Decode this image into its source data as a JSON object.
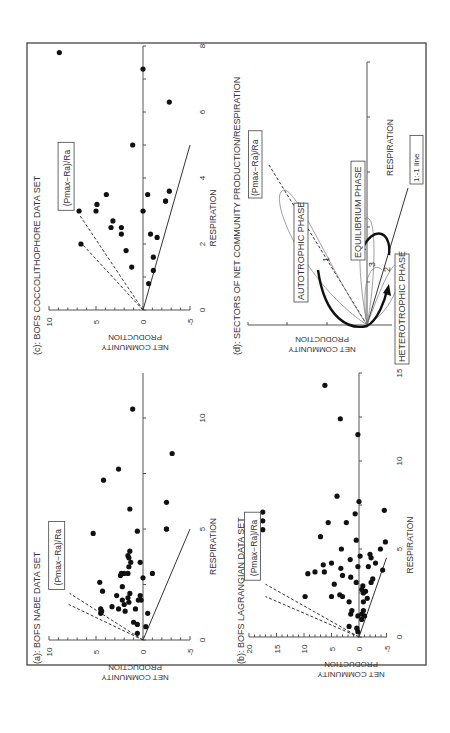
{
  "figure": {
    "orientation": "rotated 90 degrees counter-clockwise",
    "ratio_label": "(Pmax−Ra)/Ra"
  },
  "chart_data": [
    {
      "panel": "a",
      "type": "scatter",
      "title": "(a): BOFS NABE DATA SET",
      "xlabel": "RESPIRATION",
      "ylabel": "NET COMMUNITY PRODUCTION",
      "xlim": [
        0,
        13
      ],
      "ylim": [
        -5,
        10
      ],
      "x_ticks": [
        "0",
        "5",
        "10"
      ],
      "y_ticks": [
        "10",
        "5",
        "0",
        "-5"
      ],
      "annotation": "(Pmax−Ra)/Ra",
      "lines": [
        {
          "style": "solid",
          "label": "1:-1 line",
          "from": [
            0,
            0
          ],
          "to": [
            5,
            -5
          ]
        },
        {
          "style": "dashed",
          "from": [
            0,
            0
          ],
          "to": [
            2.1,
            7.8
          ]
        },
        {
          "style": "dashed",
          "from": [
            0,
            0
          ],
          "to": [
            1.6,
            7.9
          ]
        }
      ],
      "points": [
        [
          0.3,
          0.6
        ],
        [
          0.6,
          -0.3
        ],
        [
          0.8,
          1.0
        ],
        [
          0.7,
          0.6
        ],
        [
          1.2,
          -0.5
        ],
        [
          1.3,
          1.9
        ],
        [
          1.2,
          4.5
        ],
        [
          1.3,
          4.4
        ],
        [
          1.4,
          4.5
        ],
        [
          1.4,
          2.6
        ],
        [
          1.4,
          0.8
        ],
        [
          1.5,
          3.3
        ],
        [
          1.6,
          2.0
        ],
        [
          1.7,
          1.5
        ],
        [
          1.8,
          0.5
        ],
        [
          1.8,
          0.2
        ],
        [
          1.8,
          2.2
        ],
        [
          1.9,
          1.6
        ],
        [
          2.0,
          2.8
        ],
        [
          2.0,
          0.3
        ],
        [
          2.1,
          1.4
        ],
        [
          2.2,
          4.3
        ],
        [
          2.4,
          2.2
        ],
        [
          2.6,
          4.6
        ],
        [
          2.8,
          0.0
        ],
        [
          2.9,
          2.4
        ],
        [
          3.0,
          1.6
        ],
        [
          3.0,
          -1.0
        ],
        [
          3.0,
          2.0
        ],
        [
          3.0,
          2.3
        ],
        [
          3.3,
          1.5
        ],
        [
          3.5,
          1.3
        ],
        [
          3.5,
          0.3
        ],
        [
          3.7,
          1.5
        ],
        [
          3.8,
          1.6
        ],
        [
          4.0,
          1.4
        ],
        [
          4.9,
          0.6
        ],
        [
          4.8,
          5.3
        ],
        [
          5.0,
          -2.5
        ],
        [
          5.0,
          -2.5
        ],
        [
          5.9,
          1.4
        ],
        [
          6.2,
          -2.5
        ],
        [
          7.2,
          4.2
        ],
        [
          7.7,
          2.6
        ],
        [
          8.4,
          -3.1
        ],
        [
          10.4,
          1.1
        ]
      ]
    },
    {
      "panel": "b",
      "type": "scatter",
      "title": "(b): BOFS LAGRANGIAN DATA SET",
      "xlabel": "RESPIRATION",
      "ylabel": "NET COMMUNITY PRODUCTION",
      "xlim": [
        0,
        15
      ],
      "ylim": [
        -5,
        20
      ],
      "x_ticks": [
        "0",
        "5",
        "10",
        "15"
      ],
      "y_ticks": [
        "20",
        "15",
        "10",
        "5",
        "0",
        "-5"
      ],
      "annotation": "(Pmax−Ra)/Ra",
      "lines": [
        {
          "style": "solid",
          "label": "1:-1 line",
          "from": [
            0,
            0
          ],
          "to": [
            4.5,
            -5
          ]
        },
        {
          "style": "dashed",
          "from": [
            0,
            0
          ],
          "to": [
            3.0,
            17
          ]
        },
        {
          "style": "dashed",
          "from": [
            0,
            0
          ],
          "to": [
            2.3,
            17
          ]
        }
      ],
      "points": [
        [
          0.3,
          0.2
        ],
        [
          0.5,
          0.4
        ],
        [
          0.6,
          1.8
        ],
        [
          1.2,
          0.2
        ],
        [
          1.3,
          1.5
        ],
        [
          1.5,
          1.3
        ],
        [
          1.0,
          -0.5
        ],
        [
          1.2,
          -1.0
        ],
        [
          1.3,
          -0.5
        ],
        [
          1.5,
          -0.8
        ],
        [
          2.0,
          1.8
        ],
        [
          2.0,
          -0.8
        ],
        [
          2.2,
          -1.5
        ],
        [
          2.3,
          3.0
        ],
        [
          2.3,
          5.0
        ],
        [
          2.3,
          9.8
        ],
        [
          2.4,
          3.5
        ],
        [
          2.5,
          -0.8
        ],
        [
          2.6,
          -1.2
        ],
        [
          2.7,
          -0.5
        ],
        [
          2.9,
          -0.7
        ],
        [
          3.0,
          4.5
        ],
        [
          3.1,
          -2.2
        ],
        [
          3.1,
          0.5
        ],
        [
          3.3,
          -2.5
        ],
        [
          3.4,
          1.5
        ],
        [
          3.5,
          3.0
        ],
        [
          3.6,
          9.3
        ],
        [
          3.7,
          8.0
        ],
        [
          3.7,
          6.3
        ],
        [
          3.8,
          -4.3
        ],
        [
          3.9,
          3.3
        ],
        [
          4.0,
          0.2
        ],
        [
          4.0,
          -1.7
        ],
        [
          4.1,
          6.5
        ],
        [
          4.2,
          -3.0
        ],
        [
          4.2,
          5.0
        ],
        [
          4.4,
          1.6
        ],
        [
          4.5,
          -2.2
        ],
        [
          4.6,
          -0.2
        ],
        [
          4.7,
          -2.0
        ],
        [
          5.0,
          3.2
        ],
        [
          5.0,
          -3.9
        ],
        [
          5.4,
          -4.8
        ],
        [
          5.7,
          7.0
        ],
        [
          5.5,
          0.5
        ],
        [
          6.5,
          5.6
        ],
        [
          6.5,
          2.3
        ],
        [
          7.0,
          0.7
        ],
        [
          7.1,
          17.5
        ],
        [
          6.6,
          17.5
        ],
        [
          6.1,
          17.5
        ],
        [
          7.2,
          -4.6
        ],
        [
          7.7,
          0.0
        ],
        [
          8.0,
          4.0
        ],
        [
          11.5,
          0.2
        ],
        [
          12.4,
          3.4
        ],
        [
          14.3,
          6.2
        ]
      ]
    },
    {
      "panel": "c",
      "type": "scatter",
      "title": "(c): BOFS COCCOLITHOPHORE DATA SET",
      "xlabel": "RESPIRATION",
      "ylabel": "NET COMMUNITY PRODUCTION",
      "xlim": [
        0,
        8
      ],
      "ylim": [
        -5,
        10
      ],
      "x_ticks": [
        "0",
        "2",
        "4",
        "6",
        "8"
      ],
      "y_ticks": [
        "10",
        "5",
        "0",
        "-5"
      ],
      "annotation": "(Pmax−Ra)/Ra",
      "lines": [
        {
          "style": "solid",
          "label": "1:-1 line",
          "from": [
            0,
            0
          ],
          "to": [
            5,
            -5
          ]
        },
        {
          "style": "dashed",
          "from": [
            0,
            0
          ],
          "to": [
            2.9,
            6.8
          ]
        },
        {
          "style": "dashed",
          "from": [
            0,
            0
          ],
          "to": [
            2.1,
            6.8
          ]
        }
      ],
      "points": [
        [
          0.8,
          -0.6
        ],
        [
          1.2,
          -1.1
        ],
        [
          1.3,
          1.2
        ],
        [
          1.6,
          -1.1
        ],
        [
          1.8,
          1.8
        ],
        [
          2.0,
          6.6
        ],
        [
          2.2,
          -1.5
        ],
        [
          2.3,
          -0.8
        ],
        [
          2.3,
          2.3
        ],
        [
          2.5,
          2.3
        ],
        [
          2.5,
          3.4
        ],
        [
          2.7,
          3.2
        ],
        [
          3.0,
          0.0
        ],
        [
          3.0,
          6.8
        ],
        [
          3.0,
          5.0
        ],
        [
          3.2,
          4.9
        ],
        [
          3.3,
          -2.4
        ],
        [
          3.3,
          -2.4
        ],
        [
          3.5,
          -0.5
        ],
        [
          3.5,
          3.9
        ],
        [
          3.6,
          -2.8
        ],
        [
          5.0,
          1.1
        ],
        [
          6.3,
          -2.8
        ],
        [
          7.3,
          0.0
        ],
        [
          7.8,
          8.9
        ]
      ]
    },
    {
      "panel": "d",
      "type": "diagram",
      "title": "(d): SECTORS OF NET COMMUNITY PRODUCTION/RESPIRATION",
      "xlabel": "RESPIRATION",
      "ylabel": "NET COMMUNITY PRODUCTION",
      "annotations": [
        "AUTOTROPHIC PHASE",
        "EQUILIBRIUM PHASE",
        "HETEROTROPHIC PHASE",
        "1:-1 line",
        "(Pmax−Ra)/Ra",
        "1",
        "2",
        "3"
      ]
    }
  ],
  "labels": {
    "a_title": "(a): BOFS NABE DATA SET",
    "b_title": "(b): BOFS LAGRANGIAN  DATA SET",
    "c_title": "(c): BOFS COCCOLITHOPHORE DATA SET",
    "d_title": "(d): SECTORS OF NET COMMUNITY PRODUCTION/RESPIRATION",
    "ylabel_line1": "NET COMMUNITY",
    "ylabel_line2": "PRODUCTION",
    "xlabel": "RESPIRATION",
    "autotrophic": "AUTOTROPHIC PHASE",
    "equilibrium": "EQUILIBRIUM PHASE",
    "heterotrophic": "HETEROTROPHIC PHASE",
    "one_to_one": "1:-1 line",
    "n1": "1",
    "n2": "2",
    "n3": "3"
  },
  "colors": {
    "ink": "#111111",
    "axis": "#555555",
    "background": "#ffffff"
  }
}
